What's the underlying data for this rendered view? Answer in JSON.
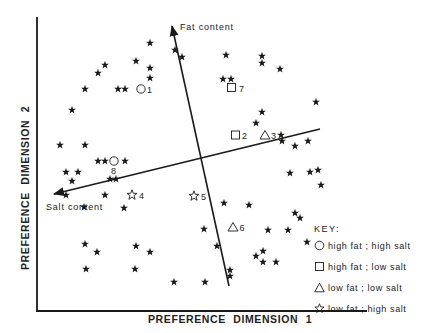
{
  "chart_data": {
    "type": "scatter",
    "title": "",
    "xlabel": "PREFERENCE  DIMENSION  1",
    "ylabel": "PREFERENCE  DIMENSION  2",
    "grid": false,
    "legend_position": "bottom-right",
    "vectors": [
      {
        "name": "Fat content",
        "from": [
          229,
          286
        ],
        "to": [
          172,
          24
        ]
      },
      {
        "name": "Salt content",
        "from": [
          320,
          129
        ],
        "to": [
          52,
          194
        ]
      }
    ],
    "legend": {
      "title": "KEY:",
      "entries": [
        {
          "symbol": "circle",
          "label": "high fat ; high salt"
        },
        {
          "symbol": "square",
          "label": "high fat ; low salt"
        },
        {
          "symbol": "triangle",
          "label": "low fat ; low salt"
        },
        {
          "symbol": "open-star",
          "label": "low fat ; high salt"
        }
      ]
    },
    "products": [
      {
        "id": "1",
        "symbol": "circle",
        "x": 141,
        "y": 89
      },
      {
        "id": "2",
        "symbol": "square",
        "x": 235,
        "y": 135
      },
      {
        "id": "3",
        "symbol": "triangle",
        "x": 265,
        "y": 135
      },
      {
        "id": "4",
        "symbol": "open-star",
        "x": 132,
        "y": 195
      },
      {
        "id": "5",
        "symbol": "open-star",
        "x": 194,
        "y": 196
      },
      {
        "id": "6",
        "symbol": "triangle",
        "x": 232,
        "y": 227
      },
      {
        "id": "7",
        "symbol": "square",
        "x": 232,
        "y": 88
      },
      {
        "id": "8",
        "symbol": "circle",
        "x": 114,
        "y": 161
      }
    ],
    "consumers": [
      [
        150,
        43
      ],
      [
        175,
        50
      ],
      [
        182,
        57
      ],
      [
        136,
        61
      ],
      [
        150,
        68
      ],
      [
        150,
        78
      ],
      [
        105,
        65
      ],
      [
        98,
        73
      ],
      [
        85,
        89
      ],
      [
        118,
        89
      ],
      [
        125,
        89
      ],
      [
        72,
        110
      ],
      [
        226,
        55
      ],
      [
        262,
        56
      ],
      [
        262,
        63
      ],
      [
        280,
        69
      ],
      [
        231,
        79
      ],
      [
        223,
        79
      ],
      [
        316,
        102
      ],
      [
        262,
        112
      ],
      [
        256,
        123
      ],
      [
        281,
        135
      ],
      [
        282,
        141
      ],
      [
        295,
        146
      ],
      [
        308,
        141
      ],
      [
        60,
        145
      ],
      [
        85,
        145
      ],
      [
        98,
        161
      ],
      [
        105,
        161
      ],
      [
        125,
        161
      ],
      [
        66,
        172
      ],
      [
        78,
        172
      ],
      [
        72,
        181
      ],
      [
        110,
        179
      ],
      [
        116,
        179
      ],
      [
        66,
        195
      ],
      [
        105,
        195
      ],
      [
        84,
        207
      ],
      [
        124,
        208
      ],
      [
        290,
        173
      ],
      [
        310,
        172
      ],
      [
        318,
        170
      ],
      [
        321,
        185
      ],
      [
        249,
        205
      ],
      [
        224,
        203
      ],
      [
        295,
        213
      ],
      [
        300,
        218
      ],
      [
        268,
        230
      ],
      [
        288,
        230
      ],
      [
        307,
        242
      ],
      [
        263,
        251
      ],
      [
        256,
        256
      ],
      [
        263,
        262
      ],
      [
        276,
        262
      ],
      [
        230,
        270
      ],
      [
        230,
        276
      ],
      [
        217,
        246
      ],
      [
        204,
        229
      ],
      [
        85,
        244
      ],
      [
        97,
        252
      ],
      [
        86,
        269
      ],
      [
        136,
        246
      ],
      [
        150,
        252
      ],
      [
        135,
        269
      ],
      [
        174,
        282
      ],
      [
        205,
        282
      ]
    ]
  },
  "labels": {
    "x_axis": "PREFERENCE  DIMENSION  1",
    "y_axis": "PREFERENCE  DIMENSION  2",
    "fat_vector": "Fat content",
    "salt_vector": "Salt content"
  },
  "key": {
    "title": "KEY:",
    "items": [
      {
        "label": "high fat ; high salt"
      },
      {
        "label": "high fat ; low salt"
      },
      {
        "label": "low fat ; low salt"
      },
      {
        "label": "low fat ; high salt"
      }
    ]
  },
  "colors": {
    "ink": "#1a1a1a",
    "background": "#ffffff"
  }
}
